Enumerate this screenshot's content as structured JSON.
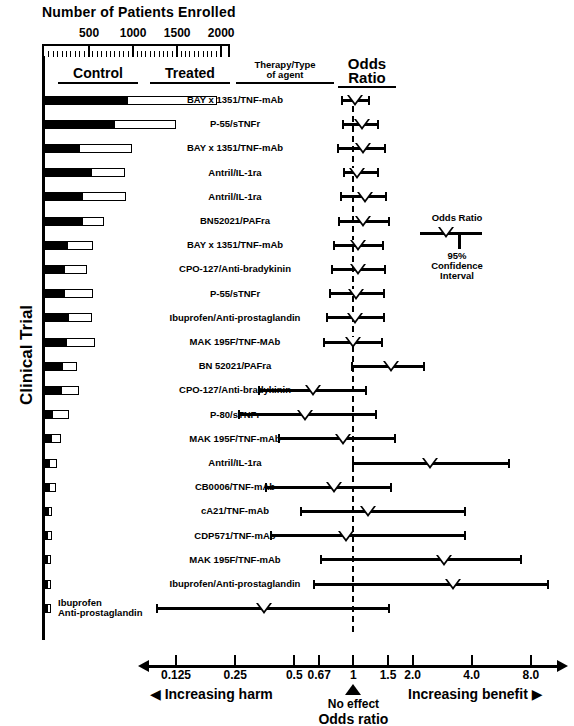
{
  "header": {
    "enrollment_title": "Number of Patients Enrolled",
    "enrollment_ticks": [
      "500",
      "1000",
      "1500",
      "2000"
    ],
    "col_control": "Control",
    "col_treated": "Treated",
    "col_therapy": "Therapy/Type<br>of agent",
    "col_therapy_line1": "Therapy/Type",
    "col_therapy_line2": "of agent",
    "col_odds_line1": "Odds",
    "col_odds_line2": "Ratio",
    "y_axis_label": "Clinical Trial"
  },
  "legend": {
    "title": "Odds Ratio",
    "sub_line1": "95%",
    "sub_line2": "Confidence",
    "sub_line3": "Interval"
  },
  "axis": {
    "tick_labels": [
      "0.125",
      "0.25",
      "0.5",
      "0.67",
      "1",
      "1.5",
      "2.0",
      "4.0",
      "8.0"
    ],
    "tick_values": [
      0.125,
      0.25,
      0.5,
      0.67,
      1,
      1.5,
      2.0,
      4.0,
      8.0
    ],
    "harm_label": "Increasing harm",
    "benefit_label": "Increasing benefit",
    "no_effect_label": "No effect",
    "title": "Odds ratio",
    "left_arrow": "◀",
    "right_arrow": "▶"
  },
  "chart_data": {
    "type": "forest",
    "xlabel": "Odds ratio",
    "ylabel": "Clinical Trial",
    "xscale": "log",
    "xlim": [
      0.09,
      11.0
    ],
    "reference_line": 1.0,
    "enrollment_axis": {
      "label": "Number of Patients Enrolled",
      "xlim": [
        0,
        2100
      ],
      "ticks": [
        500,
        1000,
        1500,
        2000
      ]
    },
    "rows": [
      {
        "label": "BAY x 1351/TNF-mAb",
        "control": 940,
        "treated": 1010,
        "total": 1950,
        "odds_ratio": 1.02,
        "ci_low": 0.87,
        "ci_high": 1.2
      },
      {
        "label": "P-55/sTNFr",
        "control": 800,
        "treated": 690,
        "total": 1490,
        "odds_ratio": 1.1,
        "ci_low": 0.89,
        "ci_high": 1.33
      },
      {
        "label": "BAY x 1351/TNF-mAb",
        "control": 400,
        "treated": 590,
        "total": 990,
        "odds_ratio": 1.12,
        "ci_low": 0.83,
        "ci_high": 1.45
      },
      {
        "label": "Antril/IL-1ra",
        "control": 530,
        "treated": 380,
        "total": 910,
        "odds_ratio": 1.04,
        "ci_low": 0.9,
        "ci_high": 1.33
      },
      {
        "label": "Antril/IL-1ra",
        "control": 435,
        "treated": 480,
        "total": 915,
        "odds_ratio": 1.15,
        "ci_low": 0.86,
        "ci_high": 1.46
      },
      {
        "label": "BN52021/PAFra",
        "control": 430,
        "treated": 240,
        "total": 670,
        "odds_ratio": 1.12,
        "ci_low": 0.84,
        "ci_high": 1.52
      },
      {
        "label": "BAY x 1351/TNF-mAb",
        "control": 260,
        "treated": 280,
        "total": 540,
        "odds_ratio": 1.06,
        "ci_low": 0.8,
        "ci_high": 1.42
      },
      {
        "label": "CPO-127/Anti-bradykinin",
        "control": 230,
        "treated": 250,
        "total": 480,
        "odds_ratio": 1.05,
        "ci_low": 0.78,
        "ci_high": 1.45
      },
      {
        "label": "P-55/sTNFr",
        "control": 220,
        "treated": 330,
        "total": 550,
        "odds_ratio": 1.03,
        "ci_low": 0.76,
        "ci_high": 1.43
      },
      {
        "label": "Ibuprofen/Anti-prostaglandin",
        "control": 270,
        "treated": 260,
        "total": 530,
        "odds_ratio": 1.02,
        "ci_low": 0.73,
        "ci_high": 1.43
      },
      {
        "label": "MAK 195F/TNF-MAb",
        "control": 250,
        "treated": 320,
        "total": 570,
        "odds_ratio": 1.0,
        "ci_low": 0.71,
        "ci_high": 1.4
      },
      {
        "label": "BN 52021/PAFra",
        "control": 200,
        "treated": 160,
        "total": 360,
        "odds_ratio": 1.55,
        "ci_low": 0.98,
        "ci_high": 2.3
      },
      {
        "label": "CPO-127/Anti-bradykinin",
        "control": 190,
        "treated": 200,
        "total": 390,
        "odds_ratio": 0.62,
        "ci_low": 0.33,
        "ci_high": 1.16
      },
      {
        "label": "P-80/sTNFr",
        "control": 90,
        "treated": 180,
        "total": 270,
        "odds_ratio": 0.57,
        "ci_low": 0.26,
        "ci_high": 1.3
      },
      {
        "label": "MAK 195F/TNF-mAb",
        "control": 75,
        "treated": 110,
        "total": 185,
        "odds_ratio": 0.88,
        "ci_low": 0.42,
        "ci_high": 1.62
      },
      {
        "label": "Antril/IL-1ra",
        "control": 60,
        "treated": 80,
        "total": 140,
        "odds_ratio": 2.45,
        "ci_low": 1.0,
        "ci_high": 6.2
      },
      {
        "label": "CB0006/TNF-mAb",
        "control": 50,
        "treated": 70,
        "total": 120,
        "odds_ratio": 0.8,
        "ci_low": 0.36,
        "ci_high": 1.55
      },
      {
        "label": "cA21/TNF-mAb",
        "control": 40,
        "treated": 40,
        "total": 80,
        "odds_ratio": 1.18,
        "ci_low": 0.54,
        "ci_high": 3.7
      },
      {
        "label": "CDP571/TNF-mAb",
        "control": 35,
        "treated": 40,
        "total": 75,
        "odds_ratio": 0.92,
        "ci_low": 0.38,
        "ci_high": 3.7
      },
      {
        "label": "MAK 195F/TNF-mAb",
        "control": 30,
        "treated": 35,
        "total": 65,
        "odds_ratio": 2.9,
        "ci_low": 0.68,
        "ci_high": 7.1
      },
      {
        "label": "Ibuprofen/Anti-prostaglandin",
        "control": 30,
        "treated": 25,
        "total": 55,
        "odds_ratio": 3.2,
        "ci_low": 0.63,
        "ci_high": 9.8
      },
      {
        "label": "Ibuprofen\nAnti-prostaglandin",
        "control": 25,
        "treated": 25,
        "total": 50,
        "odds_ratio": 0.35,
        "ci_low": 0.1,
        "ci_high": 1.52,
        "label_line1": "Ibuprofen",
        "label_line2": "Anti-prostaglandin",
        "two_line": true
      }
    ]
  }
}
